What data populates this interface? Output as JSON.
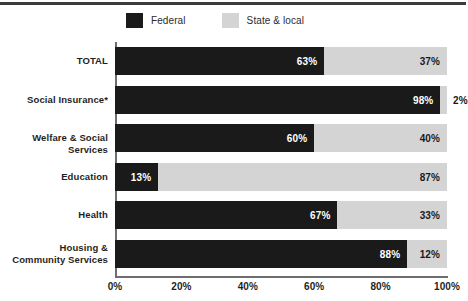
{
  "legend": {
    "items": [
      {
        "label": "Federal",
        "color": "#1a1a1a",
        "key": "federal"
      },
      {
        "label": "State & local",
        "color": "#d4d4d4",
        "key": "state"
      }
    ]
  },
  "chart_data": {
    "type": "bar",
    "orientation": "horizontal",
    "stacked": true,
    "stacked_normalized": true,
    "title": "",
    "subtitle": "",
    "xlabel": "",
    "ylabel": "",
    "xlim": [
      0,
      100
    ],
    "grid": false,
    "legend_position": "top-center",
    "categories": [
      "TOTAL",
      "Social Insurance*",
      "Welfare & Social Services",
      "Education",
      "Health",
      "Housing &\nCommunity Services"
    ],
    "xticks": [
      0,
      20,
      40,
      60,
      80,
      100
    ],
    "xticklabels": [
      "0%",
      "20%",
      "40%",
      "60%",
      "80%",
      "100%"
    ],
    "series": [
      {
        "name": "Federal",
        "color": "#1a1a1a",
        "values": [
          63,
          98,
          60,
          13,
          67,
          88
        ],
        "labels": [
          "63%",
          "98%",
          "60%",
          "13%",
          "67%",
          "88%"
        ]
      },
      {
        "name": "State & local",
        "color": "#d4d4d4",
        "values": [
          37,
          2,
          40,
          87,
          33,
          12
        ],
        "labels": [
          "37%",
          "2%",
          "40%",
          "87%",
          "33%",
          "12%"
        ]
      }
    ],
    "rows": [
      {
        "category": "TOTAL",
        "category_lines": [
          "TOTAL"
        ],
        "federal": 63,
        "federal_label": "63%",
        "state": 37,
        "state_label": "37%",
        "state_label_outside": false
      },
      {
        "category": "Social Insurance*",
        "category_lines": [
          "Social Insurance*"
        ],
        "federal": 98,
        "federal_label": "98%",
        "state": 2,
        "state_label": "2%",
        "state_label_outside": true
      },
      {
        "category": "Welfare & Social Services",
        "category_lines": [
          "Welfare & Social Services"
        ],
        "federal": 60,
        "federal_label": "60%",
        "state": 40,
        "state_label": "40%",
        "state_label_outside": false
      },
      {
        "category": "Education",
        "category_lines": [
          "Education"
        ],
        "federal": 13,
        "federal_label": "13%",
        "state": 87,
        "state_label": "87%",
        "state_label_outside": false
      },
      {
        "category": "Health",
        "category_lines": [
          "Health"
        ],
        "federal": 67,
        "federal_label": "67%",
        "state": 33,
        "state_label": "33%",
        "state_label_outside": false
      },
      {
        "category": "Housing & Community Services",
        "category_lines": [
          "Housing &",
          "Community Services"
        ],
        "federal": 88,
        "federal_label": "88%",
        "state": 12,
        "state_label": "12%",
        "state_label_outside": false
      }
    ]
  }
}
